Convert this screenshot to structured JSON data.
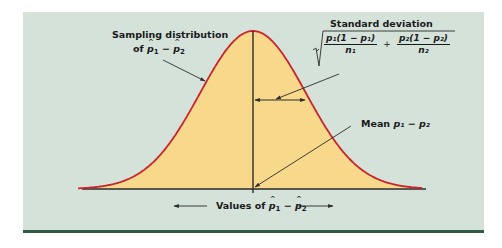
{
  "figure": {
    "background_color": "#d4e2da",
    "fill_color": "#f8d98c",
    "curve_color": "#c8242a",
    "axis_color": "#2b2b2b",
    "rule_color": "#2f5d44"
  },
  "labels": {
    "sampling_dist_line1": "Sampling distribution",
    "sampling_dist_prefix": "of ",
    "p1": "p",
    "sub1": "1",
    "minus": " − ",
    "p2": "p",
    "sub2": "2",
    "std_dev_title": "Standard deviation",
    "sd_num1": "p₁(1 − p₁)",
    "sd_den1": "n₁",
    "sd_plus": "+",
    "sd_num2": "p₂(1 − p₂)",
    "sd_den2": "n₂",
    "mean_prefix": "Mean ",
    "mean_expr": "p₁ − p₂",
    "axis_prefix": "Values of "
  },
  "chart_data": {
    "type": "area",
    "xlabel": "Values of p̂1 − p̂2",
    "ylabel": "",
    "distribution": "normal",
    "mean_label": "Mean p1 − p2",
    "sd_label": "Standard deviation sqrt(p1(1 − p1)/n1 + p2(1 − p2)/n2)",
    "x_range_sd": [
      -3.3,
      3.2
    ],
    "annotations": [
      "Sampling distribution of p̂1 − p̂2",
      "Standard deviation sqrt(p1(1−p1)/n1 + p2(1−p2)/n2)",
      "Mean p1 − p2",
      "Values of p̂1 − p̂2"
    ],
    "grid": false,
    "legend": "none"
  }
}
